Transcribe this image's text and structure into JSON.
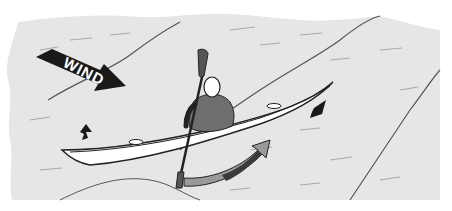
{
  "illustration": {
    "subject": "kayaker paddling in wind-driven waves",
    "wind_label": "WIND",
    "colors": {
      "water": "#e6e6e6",
      "wave_line": "#555555",
      "kayak": "#ffffff",
      "kayak_outline": "#222222",
      "paddler_body": "#6e6e6e",
      "head": "#ffffff",
      "arrow_dark": "#1a1a1a",
      "sweep_arrow_dark": "#3a3a3a",
      "sweep_arrow_light": "#9a9a9a",
      "background": "#ffffff"
    },
    "elements": [
      "wind-arrow",
      "kayak",
      "paddler",
      "paddle",
      "sweep-stroke-arrow",
      "bow-force-arrow",
      "stern-force-arrow",
      "wave-crests"
    ]
  }
}
